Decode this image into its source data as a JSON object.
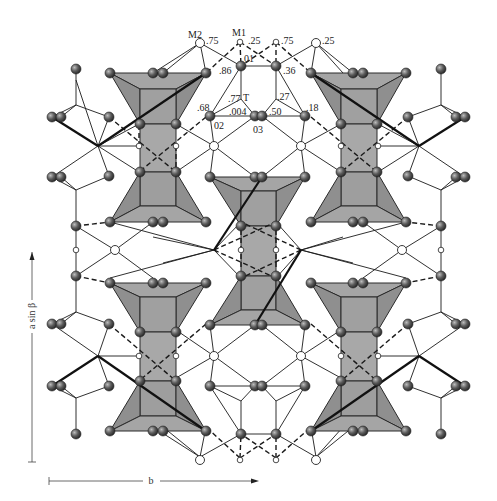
{
  "figure": {
    "type": "crystal-structure-projection",
    "colors": {
      "polyhedron_fill": "#9e9e9e",
      "polyhedron_stroke": "#2a2a2a",
      "atom_fill": "#5a5a5a",
      "bond": "#1a1a1a",
      "background": "#ffffff"
    }
  },
  "site_labels": {
    "m2": "M2",
    "m1": "M1",
    "t": "T",
    "o1": "01",
    "o2": "02",
    "o3": "03"
  },
  "height_labels": {
    "m2_height": ".75",
    "m1_height": ".25",
    "m1b_height": ".75",
    "m2b_height": ".25",
    "o1_height": ".86",
    "o1b_height": ".36",
    "t_height": ".77",
    "tb_height": ".27",
    "o2_height": ".68",
    "o2b_height": ".18",
    "o3_height": ".004",
    "o3b_height": ".50"
  },
  "axes": {
    "vertical_label": "a sin β",
    "horizontal_label": "b"
  }
}
